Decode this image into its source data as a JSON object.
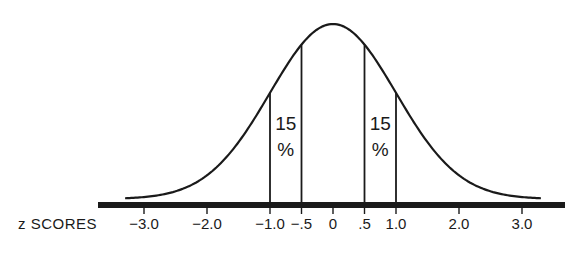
{
  "chart_data": {
    "type": "line",
    "title": "",
    "xlabel": "z SCORES",
    "ylabel": "",
    "xlim": [
      -3.5,
      3.5
    ],
    "grid": false,
    "legend": null,
    "ticks": [
      {
        "value": -3.0,
        "label": "-3.0"
      },
      {
        "value": -2.0,
        "label": "-2.0"
      },
      {
        "value": -1.0,
        "label": "-1.0"
      },
      {
        "value": -0.5,
        "label": "-.5"
      },
      {
        "value": 0,
        "label": "0"
      },
      {
        "value": 0.5,
        "label": ".5"
      },
      {
        "value": 1.0,
        "label": "1.0"
      },
      {
        "value": 2.0,
        "label": "2.0"
      },
      {
        "value": 3.0,
        "label": "3.0"
      }
    ],
    "vertical_lines": [
      -1.0,
      -0.5,
      0.5,
      1.0
    ],
    "annotations": [
      {
        "region": [
          -1.0,
          -0.5
        ],
        "line1": "15",
        "line2": "%"
      },
      {
        "region": [
          0.5,
          1.0
        ],
        "line1": "15",
        "line2": "%"
      }
    ],
    "curve": {
      "mean": 0,
      "sd": 1,
      "x_range": [
        -3.3,
        3.3
      ]
    }
  },
  "colors": {
    "ink": "#1a1a1a",
    "background": "#ffffff"
  }
}
